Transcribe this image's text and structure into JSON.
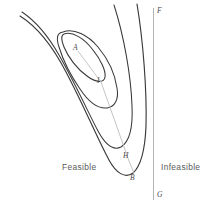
{
  "figure": {
    "type": "contour-diagram",
    "background_color": "#ffffff",
    "contour_color": "#3a3a3a",
    "boundary_color": "#b4b4b4",
    "path_color": "#b0b0b0"
  },
  "regions": [
    {
      "id": "feasible",
      "label": "Feasible",
      "x": 62,
      "y": 166
    },
    {
      "id": "infeasible",
      "label": "Infeasible",
      "x": 161,
      "y": 166
    }
  ],
  "points": [
    {
      "id": "A",
      "label": "A",
      "x": 77,
      "y": 50,
      "lx": 74,
      "ly": 45
    },
    {
      "id": "I",
      "label": "I",
      "x": 101,
      "y": 83,
      "lx": 98,
      "ly": 78
    },
    {
      "id": "H",
      "label": "H",
      "x": 128,
      "y": 160,
      "lx": 124,
      "ly": 155
    },
    {
      "id": "B",
      "label": "B",
      "x": 133,
      "y": 176,
      "lx": 130,
      "ly": 172
    },
    {
      "id": "F",
      "label": "F",
      "x": 154,
      "y": 9,
      "lx": 157,
      "ly": 6
    },
    {
      "id": "G",
      "label": "G",
      "x": 154,
      "y": 198,
      "lx": 157,
      "ly": 192
    }
  ],
  "boundary_line": {
    "id": "FG",
    "from_label": "F",
    "to_label": "G",
    "x": 153.5,
    "y_top": 8,
    "y_bottom": 200
  },
  "path_segments": [
    {
      "id": "A-I",
      "from": "A",
      "to": "I"
    },
    {
      "id": "I-H",
      "from": "I",
      "to": "H"
    }
  ],
  "contours": [
    {
      "id": "contour-inner-ellipse",
      "level": 1
    },
    {
      "id": "contour-2",
      "level": 2
    },
    {
      "id": "contour-3",
      "level": 3
    },
    {
      "id": "contour-4",
      "level": 4
    }
  ]
}
